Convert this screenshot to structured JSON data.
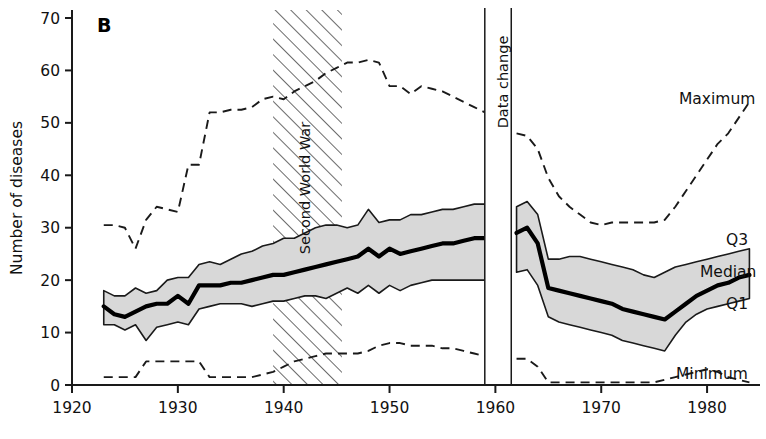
{
  "figure": {
    "panel_letter": "B",
    "ylabel": "Number of diseases",
    "xlabel": ""
  },
  "annotations": [
    {
      "name": "second-world-war",
      "text": "Second World War",
      "x_start": 1939,
      "x_end": 1945.5,
      "style": "hatched-band"
    },
    {
      "name": "data-change",
      "text": "Data change",
      "x_start": 1959,
      "x_end": 1961.5,
      "style": "white-gap-band"
    }
  ],
  "series_labels": {
    "maximum": "Maximum",
    "q3": "Q3",
    "median": "Median",
    "q1": "Q1",
    "minimum": "Minimum"
  },
  "colors": {
    "band_fill": "#d8d8d8",
    "band_edge": "#1a1a1a",
    "median_line": "#000000",
    "dashed_line": "#1a1a1a",
    "axis": "#1a1a1a",
    "background": "#ffffff"
  },
  "chart_data": {
    "type": "line",
    "title": "",
    "xlabel": "",
    "ylabel": "Number of diseases",
    "xlim": [
      1920,
      1985
    ],
    "ylim": [
      0,
      70
    ],
    "xticks": [
      1920,
      1930,
      1940,
      1950,
      1960,
      1970,
      1980
    ],
    "yticks": [
      0,
      10,
      20,
      30,
      40,
      50,
      60,
      70
    ],
    "grid": false,
    "legend": "inline-right-labels",
    "segments": [
      "1923-1959",
      "1962-1984"
    ],
    "series": [
      {
        "name": "Maximum",
        "style": "dashed",
        "x": [
          1923,
          1924,
          1925,
          1926,
          1927,
          1928,
          1929,
          1930,
          1931,
          1932,
          1933,
          1934,
          1935,
          1936,
          1937,
          1938,
          1939,
          1940,
          1941,
          1942,
          1943,
          1944,
          1945,
          1946,
          1947,
          1948,
          1949,
          1950,
          1951,
          1952,
          1953,
          1954,
          1955,
          1956,
          1957,
          1958,
          1959
        ],
        "y": [
          30.5,
          30.5,
          30.0,
          26.0,
          31.5,
          34.0,
          33.5,
          33.0,
          42.0,
          42.0,
          52.0,
          52.0,
          52.5,
          52.5,
          53.0,
          54.5,
          55.0,
          54.5,
          56.0,
          57.0,
          58.0,
          59.5,
          60.5,
          61.5,
          61.5,
          62.0,
          61.5,
          57.0,
          57.0,
          55.5,
          57.0,
          56.5,
          56.0,
          55.0,
          54.0,
          53.0,
          52.0
        ]
      },
      {
        "name": "Maximum",
        "style": "dashed",
        "segment": 2,
        "x": [
          1962,
          1963,
          1964,
          1965,
          1966,
          1967,
          1968,
          1969,
          1970,
          1971,
          1972,
          1973,
          1974,
          1975,
          1976,
          1977,
          1978,
          1979,
          1980,
          1981,
          1982,
          1983,
          1984
        ],
        "y": [
          48.0,
          47.5,
          45.0,
          39.5,
          36.0,
          34.0,
          32.5,
          31.0,
          30.5,
          31.0,
          31.0,
          31.0,
          31.0,
          31.0,
          31.5,
          34.0,
          37.0,
          40.0,
          43.0,
          46.0,
          48.0,
          51.0,
          54.0
        ]
      },
      {
        "name": "Q3",
        "style": "solid-thin",
        "x": [
          1923,
          1924,
          1925,
          1926,
          1927,
          1928,
          1929,
          1930,
          1931,
          1932,
          1933,
          1934,
          1935,
          1936,
          1937,
          1938,
          1939,
          1940,
          1941,
          1942,
          1943,
          1944,
          1945,
          1946,
          1947,
          1948,
          1949,
          1950,
          1951,
          1952,
          1953,
          1954,
          1955,
          1956,
          1957,
          1958,
          1959
        ],
        "y": [
          18.0,
          17.0,
          17.0,
          18.5,
          17.5,
          18.0,
          20.0,
          20.5,
          20.5,
          23.0,
          23.5,
          23.0,
          24.0,
          25.0,
          25.5,
          26.5,
          27.0,
          28.0,
          28.0,
          29.0,
          30.0,
          30.5,
          30.5,
          30.0,
          30.5,
          33.5,
          31.0,
          31.5,
          31.5,
          32.5,
          32.5,
          33.0,
          33.5,
          33.5,
          34.0,
          34.5,
          34.5
        ]
      },
      {
        "name": "Q3",
        "style": "solid-thin",
        "segment": 2,
        "x": [
          1962,
          1963,
          1964,
          1965,
          1966,
          1967,
          1968,
          1969,
          1970,
          1971,
          1972,
          1973,
          1974,
          1975,
          1976,
          1977,
          1978,
          1979,
          1980,
          1981,
          1982,
          1983,
          1984
        ],
        "y": [
          34.0,
          35.0,
          32.5,
          24.0,
          24.0,
          24.5,
          24.5,
          24.0,
          23.5,
          23.0,
          22.5,
          22.0,
          21.0,
          20.5,
          21.5,
          22.5,
          23.0,
          23.5,
          24.0,
          24.5,
          25.0,
          25.5,
          26.0
        ]
      },
      {
        "name": "Median",
        "style": "solid-thick",
        "x": [
          1923,
          1924,
          1925,
          1926,
          1927,
          1928,
          1929,
          1930,
          1931,
          1932,
          1933,
          1934,
          1935,
          1936,
          1937,
          1938,
          1939,
          1940,
          1941,
          1942,
          1943,
          1944,
          1945,
          1946,
          1947,
          1948,
          1949,
          1950,
          1951,
          1952,
          1953,
          1954,
          1955,
          1956,
          1957,
          1958,
          1959
        ],
        "y": [
          15.0,
          13.5,
          13.0,
          14.0,
          15.0,
          15.5,
          15.5,
          17.0,
          15.5,
          19.0,
          19.0,
          19.0,
          19.5,
          19.5,
          20.0,
          20.5,
          21.0,
          21.0,
          21.5,
          22.0,
          22.5,
          23.0,
          23.5,
          24.0,
          24.5,
          26.0,
          24.5,
          26.0,
          25.0,
          25.5,
          26.0,
          26.5,
          27.0,
          27.0,
          27.5,
          28.0,
          28.0
        ]
      },
      {
        "name": "Median",
        "style": "solid-thick",
        "segment": 2,
        "x": [
          1962,
          1963,
          1964,
          1965,
          1966,
          1967,
          1968,
          1969,
          1970,
          1971,
          1972,
          1973,
          1974,
          1975,
          1976,
          1977,
          1978,
          1979,
          1980,
          1981,
          1982,
          1983,
          1984
        ],
        "y": [
          29.0,
          30.0,
          27.0,
          18.5,
          18.0,
          17.5,
          17.0,
          16.5,
          16.0,
          15.5,
          14.5,
          14.0,
          13.5,
          13.0,
          12.5,
          14.0,
          15.5,
          17.0,
          18.0,
          19.0,
          19.5,
          20.5,
          21.0
        ]
      },
      {
        "name": "Q1",
        "style": "solid-thin",
        "x": [
          1923,
          1924,
          1925,
          1926,
          1927,
          1928,
          1929,
          1930,
          1931,
          1932,
          1933,
          1934,
          1935,
          1936,
          1937,
          1938,
          1939,
          1940,
          1941,
          1942,
          1943,
          1944,
          1945,
          1946,
          1947,
          1948,
          1949,
          1950,
          1951,
          1952,
          1953,
          1954,
          1955,
          1956,
          1957,
          1958,
          1959
        ],
        "y": [
          11.5,
          11.5,
          10.5,
          11.5,
          8.5,
          11.0,
          11.5,
          12.0,
          11.5,
          14.5,
          15.0,
          15.5,
          15.5,
          15.5,
          15.0,
          15.5,
          16.0,
          16.0,
          16.5,
          17.0,
          17.0,
          16.5,
          17.5,
          18.5,
          17.5,
          19.0,
          17.5,
          19.0,
          18.0,
          19.0,
          19.5,
          20.0,
          20.0,
          20.0,
          20.0,
          20.0,
          20.0
        ]
      },
      {
        "name": "Q1",
        "style": "solid-thin",
        "segment": 2,
        "x": [
          1962,
          1963,
          1964,
          1965,
          1966,
          1967,
          1968,
          1969,
          1970,
          1971,
          1972,
          1973,
          1974,
          1975,
          1976,
          1977,
          1978,
          1979,
          1980,
          1981,
          1982,
          1983,
          1984
        ],
        "y": [
          21.5,
          22.0,
          19.0,
          13.0,
          12.0,
          11.5,
          11.0,
          10.5,
          10.0,
          9.5,
          8.5,
          8.0,
          7.5,
          7.0,
          6.5,
          9.5,
          12.0,
          13.5,
          14.5,
          15.0,
          15.5,
          16.0,
          16.5
        ]
      },
      {
        "name": "Minimum",
        "style": "dashed",
        "x": [
          1923,
          1924,
          1925,
          1926,
          1927,
          1928,
          1929,
          1930,
          1931,
          1932,
          1933,
          1934,
          1935,
          1936,
          1937,
          1938,
          1939,
          1940,
          1941,
          1942,
          1943,
          1944,
          1945,
          1946,
          1947,
          1948,
          1949,
          1950,
          1951,
          1952,
          1953,
          1954,
          1955,
          1956,
          1957,
          1958,
          1959
        ],
        "y": [
          1.5,
          1.5,
          1.5,
          1.5,
          4.5,
          4.5,
          4.5,
          4.5,
          4.5,
          4.5,
          1.5,
          1.5,
          1.5,
          1.5,
          1.5,
          2.0,
          2.5,
          3.5,
          4.5,
          5.0,
          5.5,
          6.0,
          6.0,
          6.0,
          6.0,
          6.5,
          7.5,
          8.0,
          8.0,
          7.5,
          7.5,
          7.5,
          7.0,
          7.0,
          6.5,
          6.0,
          5.5
        ]
      },
      {
        "name": "Minimum",
        "style": "dashed",
        "segment": 2,
        "x": [
          1962,
          1963,
          1964,
          1965,
          1966,
          1967,
          1968,
          1969,
          1970,
          1971,
          1972,
          1973,
          1974,
          1975,
          1976,
          1977,
          1978,
          1979,
          1980,
          1981,
          1982,
          1983,
          1984
        ],
        "y": [
          5.0,
          5.0,
          3.5,
          0.5,
          0.5,
          0.5,
          0.5,
          0.5,
          0.5,
          0.5,
          0.5,
          0.5,
          0.5,
          0.5,
          1.0,
          1.5,
          2.0,
          2.5,
          3.0,
          2.5,
          1.5,
          1.0,
          0.5
        ]
      }
    ]
  }
}
